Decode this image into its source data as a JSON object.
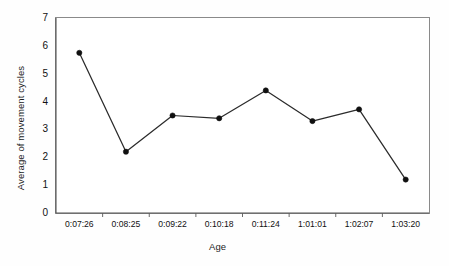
{
  "chart_data": {
    "type": "line",
    "title": "",
    "xlabel": "Age",
    "ylabel": "Average of movement cycles",
    "categories": [
      "0:07:26",
      "0:08:25",
      "0:09:22",
      "0:10:18",
      "0:11:24",
      "1:01:01",
      "1:02:07",
      "1:03:20"
    ],
    "values": [
      5.75,
      2.2,
      3.5,
      3.4,
      4.4,
      3.3,
      3.72,
      1.2
    ],
    "series": [
      {
        "name": "Average of movement cycles",
        "values": [
          5.75,
          2.2,
          3.5,
          3.4,
          4.4,
          3.3,
          3.72,
          1.2
        ]
      }
    ],
    "ylim": [
      0,
      7
    ],
    "y_ticks": [
      0,
      1,
      2,
      3,
      4,
      5,
      6,
      7
    ],
    "y_tick_labels": [
      "0",
      "1",
      "2",
      "3",
      "4",
      "5",
      "6",
      "7"
    ],
    "grid": "horizontal-dotted",
    "legend": "none",
    "marker": "filled-circle",
    "line_color": "#2b2b2b",
    "marker_color": "#101010",
    "grid_color": "#b9b9b9",
    "plot_background": "#ffffff",
    "axis_color": "#555555"
  },
  "axes": {
    "y_title": "Average of movement cycles",
    "x_title": "Age"
  }
}
